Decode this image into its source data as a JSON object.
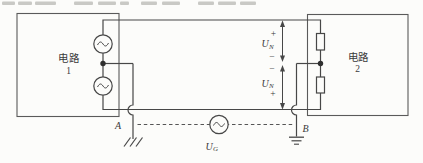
{
  "colors": {
    "background": "#fcfcfa",
    "ink": "#474747",
    "text": "#3a3a3a"
  },
  "left_box": {
    "title": "电路",
    "number": "1"
  },
  "right_box": {
    "title": "电路",
    "number": "2"
  },
  "node_labels": {
    "a": "A",
    "b": "B"
  },
  "voltage_upper": {
    "plus": "+",
    "u": "U",
    "sub": "N",
    "minus": "−"
  },
  "voltage_lower": {
    "minus": "−",
    "u": "U",
    "sub": "N",
    "plus": "+"
  },
  "source_label": {
    "u": "U",
    "sub": "G"
  },
  "icons": {
    "ac_source_symbol": "~",
    "chassis_ground": "three-slash-ground",
    "earth_ground": "three-bar-ground"
  }
}
